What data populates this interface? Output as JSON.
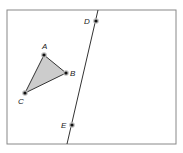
{
  "diagram": {
    "frame": {
      "x": 7,
      "y": 10,
      "width": 169,
      "height": 134,
      "stroke": "#888888"
    },
    "triangle": {
      "fill": "#cccccc",
      "stroke": "#333333",
      "vertices": [
        "A",
        "B",
        "C"
      ]
    },
    "line": {
      "x1": 98,
      "y1": 10,
      "x2": 67,
      "y2": 144,
      "stroke": "#333333",
      "through": [
        "D",
        "E"
      ]
    },
    "points": {
      "A": {
        "label": "A",
        "x": 44,
        "y": 55,
        "lx": 42,
        "ly": 49
      },
      "B": {
        "label": "B",
        "x": 66,
        "y": 73,
        "lx": 70,
        "ly": 76
      },
      "C": {
        "label": "C",
        "x": 25,
        "y": 93,
        "lx": 18,
        "ly": 104
      },
      "D": {
        "label": "D",
        "x": 96,
        "y": 21,
        "lx": 84,
        "ly": 24
      },
      "E": {
        "label": "E",
        "x": 72,
        "y": 125,
        "lx": 61,
        "ly": 128
      }
    }
  }
}
